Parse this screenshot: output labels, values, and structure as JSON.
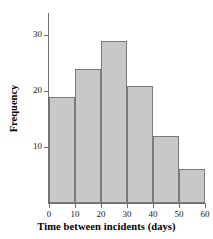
{
  "chart_data": {
    "type": "bar",
    "title": "",
    "subtitle": "",
    "xlabel": "Time between incidents (days)",
    "ylabel": "Frequency",
    "categories": [
      "0-10",
      "10-20",
      "20-30",
      "30-40",
      "40-50",
      "50-60"
    ],
    "bin_edges": [
      0,
      10,
      20,
      30,
      40,
      50,
      60
    ],
    "values": [
      19,
      24,
      29,
      21,
      12,
      6
    ],
    "xlim": [
      0,
      60
    ],
    "ylim": [
      0,
      34
    ],
    "xticks": [
      "0",
      "10",
      "20",
      "30",
      "40",
      "50",
      "60"
    ],
    "xtick_values": [
      0,
      10,
      20,
      30,
      40,
      50,
      60
    ],
    "yticks": [
      "10",
      "20",
      "30"
    ],
    "ytick_values": [
      10,
      20,
      30
    ],
    "grid": false,
    "legend": null,
    "bar_fill_color": "#c8c8c8",
    "bar_edge_color": "#7a7a7a",
    "axis_color": "#6e6e6e",
    "background_color": "#ffffff",
    "text_color": "#000000"
  }
}
